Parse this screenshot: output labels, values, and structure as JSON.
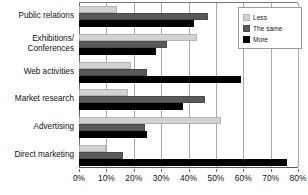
{
  "chart_data": {
    "type": "bar",
    "orientation": "horizontal",
    "title": "",
    "xlabel": "",
    "ylabel": "",
    "xlim": [
      0,
      80
    ],
    "xtick_labels": [
      "0%",
      "10%",
      "20%",
      "30%",
      "40%",
      "50%",
      "60%",
      "70%",
      "80%"
    ],
    "xticks": [
      0,
      10,
      20,
      30,
      40,
      50,
      60,
      70,
      80
    ],
    "grid": true,
    "legend_position": "top-right",
    "categories": [
      "Public relations",
      "Exhibitions/\nConferences",
      "Web activities",
      "Market research",
      "Advertising",
      "Direct marketing"
    ],
    "series": [
      {
        "name": "Less",
        "color": "#d2d2d2",
        "values": [
          14,
          43,
          19,
          18,
          52,
          10
        ]
      },
      {
        "name": "The same",
        "color": "#595959",
        "values": [
          47,
          32,
          25,
          46,
          24,
          16
        ]
      },
      {
        "name": "More",
        "color": "#000000",
        "values": [
          42,
          28,
          59,
          38,
          25,
          76
        ]
      }
    ]
  },
  "legend": {
    "items": [
      {
        "label": "Less"
      },
      {
        "label": "The same"
      },
      {
        "label": "More"
      }
    ]
  },
  "categories_display": [
    {
      "lines": [
        "Public relations"
      ]
    },
    {
      "lines": [
        "Exhibitions/",
        "Conferences"
      ]
    },
    {
      "lines": [
        "Web activities"
      ]
    },
    {
      "lines": [
        "Market research"
      ]
    },
    {
      "lines": [
        "Advertising"
      ]
    },
    {
      "lines": [
        "Direct marketing"
      ]
    }
  ]
}
